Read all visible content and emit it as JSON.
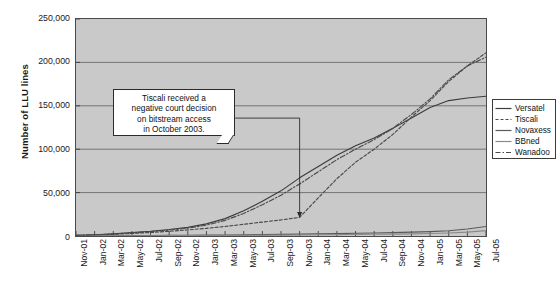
{
  "chart_data": {
    "type": "line",
    "title": "",
    "xlabel": "",
    "ylabel": "Number of LLU lines",
    "ylim": [
      0,
      250000
    ],
    "ytick_labels": [
      "250,000",
      "200,000",
      "150,000",
      "100,000",
      "50,000",
      "0"
    ],
    "ytick_values": [
      250000,
      200000,
      150000,
      100000,
      50000,
      0
    ],
    "grid": "horizontal",
    "legend_position": "right",
    "categories": [
      "Nov-01",
      "Jan-02",
      "Mar-02",
      "May-02",
      "Jul-02",
      "Sep-02",
      "Nov-02",
      "Jan-03",
      "Mar-03",
      "May-03",
      "Jul-03",
      "Sep-03",
      "Nov-03",
      "Jan-04",
      "Mar-04",
      "May-04",
      "Jul-04",
      "Sep-04",
      "Nov-04",
      "Jan-05",
      "Mar-05",
      "May-05",
      "Jul-05"
    ],
    "series": [
      {
        "name": "Versatel",
        "style": "solid",
        "color": "#3c3c3c",
        "values": [
          800,
          1500,
          2600,
          4000,
          5500,
          7500,
          10000,
          14000,
          20000,
          29000,
          40000,
          52000,
          67000,
          80000,
          93000,
          104000,
          113000,
          124000,
          136000,
          148000,
          156000,
          159000,
          161000
        ]
      },
      {
        "name": "Tiscali",
        "style": "dashed",
        "color": "#4a4a4a",
        "values": [
          600,
          1100,
          1900,
          2900,
          4000,
          5400,
          7000,
          8800,
          11000,
          13500,
          16000,
          18500,
          21500,
          44000,
          66000,
          85000,
          100000,
          117000,
          137000,
          156000,
          178000,
          196000,
          211000
        ]
      },
      {
        "name": "Novaxess",
        "style": "solid",
        "color": "#5a5a5a",
        "values": [
          100,
          200,
          300,
          400,
          500,
          650,
          800,
          1000,
          1200,
          1400,
          1600,
          1900,
          2200,
          2500,
          2800,
          3100,
          3500,
          3900,
          4400,
          5000,
          6000,
          8000,
          11000
        ]
      },
      {
        "name": "BBned",
        "style": "solid",
        "color": "#8a8a8a",
        "values": [
          50,
          100,
          150,
          220,
          300,
          380,
          470,
          560,
          660,
          780,
          900,
          1050,
          1200,
          1380,
          1560,
          1760,
          1980,
          2220,
          2500,
          2850,
          3400,
          4400,
          6200
        ]
      },
      {
        "name": "Wanadoo",
        "style": "dashdot",
        "color": "#4a4a4a",
        "values": [
          700,
          1300,
          2300,
          3600,
          5000,
          6800,
          9000,
          12500,
          18000,
          26000,
          36000,
          47000,
          60000,
          74000,
          88000,
          100000,
          111000,
          124000,
          140000,
          158000,
          180000,
          196000,
          206000
        ]
      }
    ],
    "annotation": {
      "lines": [
        "Tiscali received a",
        "negative court decision",
        "on bitstream access",
        "in October 2003."
      ],
      "points_to_category": "Nov-03",
      "points_to_value": 21500
    }
  }
}
